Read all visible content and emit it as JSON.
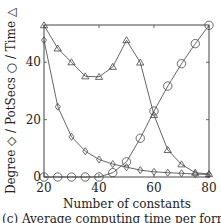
{
  "chart_data": {
    "type": "line",
    "title": "",
    "xlabel": "Number of constants",
    "ylabel": "Degree ◇ / PotSecs ○ / Time △",
    "x": [
      20,
      25,
      30,
      35,
      40,
      45,
      50,
      55,
      60,
      65,
      70,
      75,
      80
    ],
    "xlim": [
      20,
      80
    ],
    "ylim": [
      0,
      53
    ],
    "xticks": [
      20,
      40,
      60,
      80
    ],
    "yticks": [
      0,
      20,
      40
    ],
    "grid": false,
    "legend": "none (markers named in y-axis label)",
    "series": [
      {
        "name": "Time",
        "marker": "triangle",
        "values": [
          52.9,
          44.8,
          40.0,
          35.1,
          34.9,
          38.4,
          47.7,
          39.9,
          21.6,
          9.4,
          4.4,
          1.5,
          1.0
        ]
      },
      {
        "name": "Degree",
        "marker": "diamond",
        "values": [
          47.7,
          24.5,
          14.0,
          9.0,
          6.1,
          4.5,
          3.4,
          2.4,
          1.8,
          1.5,
          1.3,
          1.0,
          0.9
        ]
      },
      {
        "name": "PotSecs",
        "marker": "circle",
        "values": [
          0,
          0,
          0,
          0,
          0,
          1.5,
          5.3,
          13.5,
          23.0,
          31.7,
          39.5,
          46.5,
          52.9
        ]
      }
    ]
  },
  "labels": {
    "xlabel": "Number of constants",
    "ylabel": "Degree ◇ / PotSecs ○ / Time △",
    "xticks": [
      "20",
      "40",
      "60",
      "80"
    ],
    "yticks": [
      "0",
      "20",
      "40"
    ],
    "caption": "(c) Average computing time per formula"
  }
}
